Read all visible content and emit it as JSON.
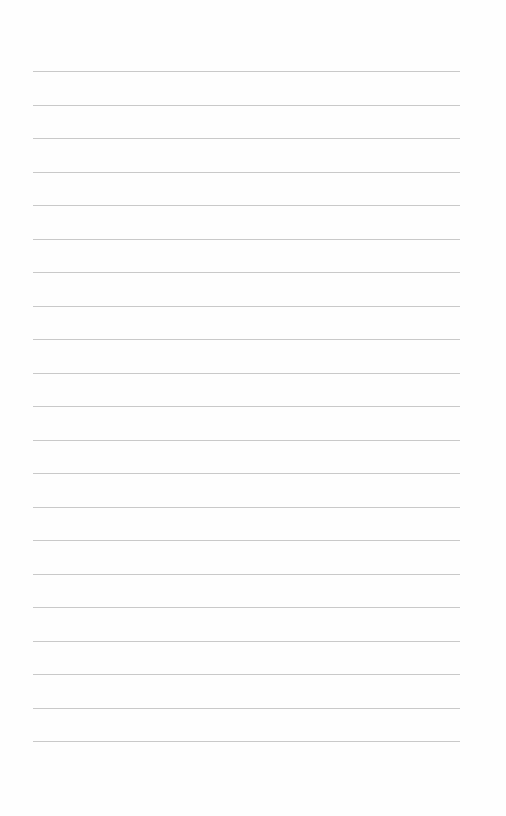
{
  "page": {
    "type": "lined-paper",
    "background_color": "#fefefe",
    "rule_color": "#c9c9c9",
    "rule_count": 21,
    "first_rule_y": 71,
    "rule_spacing": 33.5,
    "rule_left": 33,
    "rule_right": 460
  }
}
